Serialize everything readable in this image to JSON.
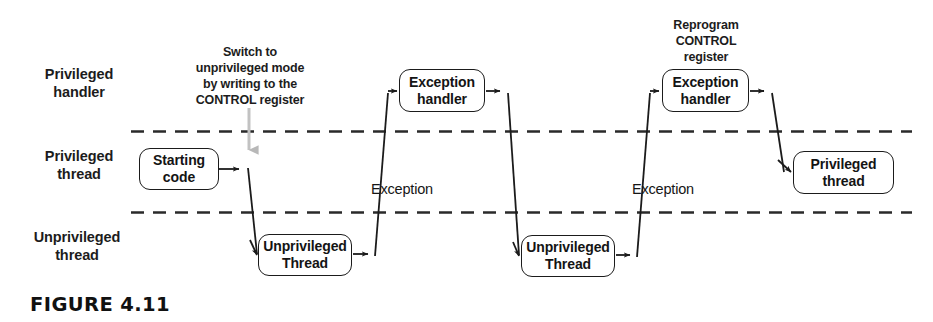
{
  "figure": {
    "caption": "FIGURE 4.11"
  },
  "lanes": [
    {
      "id": "privileged-handler",
      "label": "Privileged\nhandler"
    },
    {
      "id": "privileged-thread",
      "label": "Privileged\nthread"
    },
    {
      "id": "unprivileged-thread",
      "label": "Unprivileged\nthread"
    }
  ],
  "nodes": [
    {
      "id": "starting-code",
      "label": "Starting\ncode",
      "lane": "privileged-thread"
    },
    {
      "id": "unprivileged-thread-1",
      "label": "Unprivileged\nThread",
      "lane": "unprivileged-thread"
    },
    {
      "id": "exception-handler-1",
      "label": "Exception\nhandler",
      "lane": "privileged-handler"
    },
    {
      "id": "unprivileged-thread-2",
      "label": "Unprivileged\nThread",
      "lane": "unprivileged-thread"
    },
    {
      "id": "exception-handler-2",
      "label": "Exception\nhandler",
      "lane": "privileged-handler"
    },
    {
      "id": "privileged-thread-end",
      "label": "Privileged\nthread",
      "lane": "privileged-thread"
    }
  ],
  "annotations": [
    {
      "id": "switch-note",
      "text": "Switch to\nunprivileged mode\nby writing to the\nCONTROL register"
    },
    {
      "id": "reprogram-note",
      "text": "Reprogram\nCONTROL\nregister"
    }
  ],
  "edge_labels": [
    {
      "id": "exception-label-1",
      "text": "Exception"
    },
    {
      "id": "exception-label-2",
      "text": "Exception"
    }
  ],
  "colors": {
    "stroke": "#1b1b1b",
    "text": "#1a1a1a",
    "background": "#ffffff",
    "annotation_arrow": "#b4b4b4",
    "divider": "#2a2a2a"
  }
}
